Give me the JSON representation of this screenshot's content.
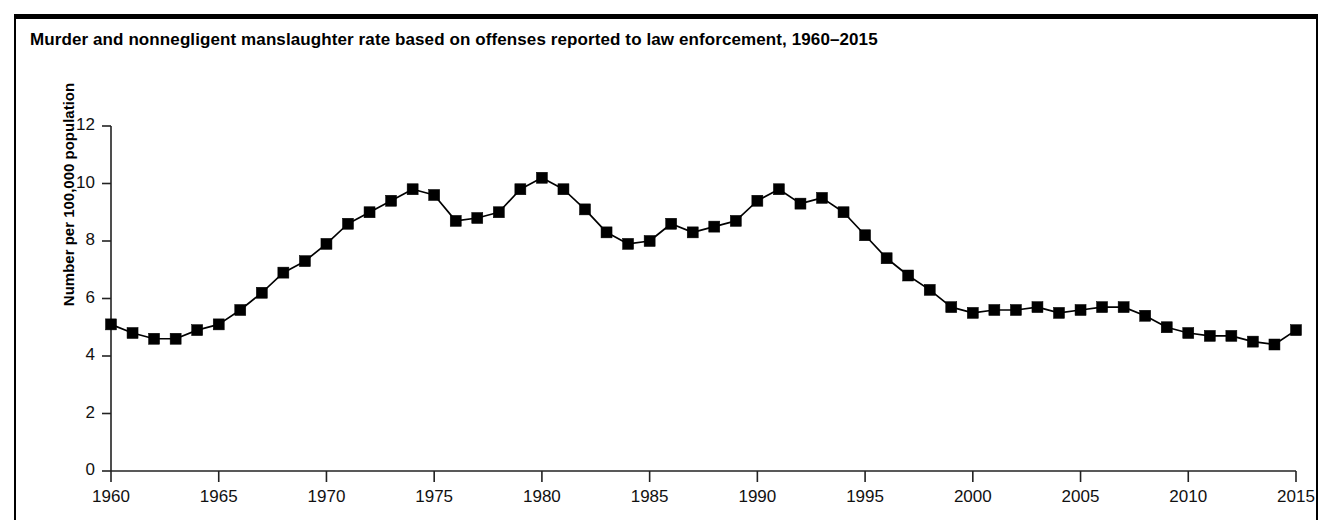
{
  "figure": {
    "title": "Murder and nonnegligent manslaughter rate based on offenses reported to law enforcement, 1960–2015",
    "background_color": "#ffffff",
    "frame_color": "#000000"
  },
  "chart_data": {
    "type": "line",
    "title": "Murder and nonnegligent manslaughter rate based on offenses reported to law enforcement, 1960–2015",
    "xlabel": "",
    "ylabel": "Number per 100,000 population",
    "xlim": [
      1960,
      2015
    ],
    "ylim": [
      0,
      12
    ],
    "ytick_values": [
      0,
      2,
      4,
      6,
      8,
      10,
      12
    ],
    "ytick_labels": [
      "0",
      "2",
      "4",
      "6",
      "8",
      "10",
      "12"
    ],
    "xtick_values": [
      1960,
      1965,
      1970,
      1975,
      1980,
      1985,
      1990,
      1995,
      2000,
      2005,
      2010,
      2015
    ],
    "xtick_labels": [
      "1960",
      "1965",
      "1970",
      "1975",
      "1980",
      "1985",
      "1990",
      "1995",
      "2000",
      "2005",
      "2010",
      "2015"
    ],
    "grid": false,
    "legend": null,
    "marker": "square",
    "marker_color": "#000000",
    "line_color": "#000000",
    "series": [
      {
        "name": "Murder and nonnegligent manslaughter rate",
        "x": [
          1960,
          1961,
          1962,
          1963,
          1964,
          1965,
          1966,
          1967,
          1968,
          1969,
          1970,
          1971,
          1972,
          1973,
          1974,
          1975,
          1976,
          1977,
          1978,
          1979,
          1980,
          1981,
          1982,
          1983,
          1984,
          1985,
          1986,
          1987,
          1988,
          1989,
          1990,
          1991,
          1992,
          1993,
          1994,
          1995,
          1996,
          1997,
          1998,
          1999,
          2000,
          2001,
          2002,
          2003,
          2004,
          2005,
          2006,
          2007,
          2008,
          2009,
          2010,
          2011,
          2012,
          2013,
          2014,
          2015
        ],
        "values": [
          5.1,
          4.8,
          4.6,
          4.6,
          4.9,
          5.1,
          5.6,
          6.2,
          6.9,
          7.3,
          7.9,
          8.6,
          9.0,
          9.4,
          9.8,
          9.6,
          8.7,
          8.8,
          9.0,
          9.8,
          10.2,
          9.8,
          9.1,
          8.3,
          7.9,
          8.0,
          8.6,
          8.3,
          8.5,
          8.7,
          9.4,
          9.8,
          9.3,
          9.5,
          9.0,
          8.2,
          7.4,
          6.8,
          6.3,
          5.7,
          5.5,
          5.6,
          5.6,
          5.7,
          5.5,
          5.6,
          5.7,
          5.7,
          5.4,
          5.0,
          4.8,
          4.7,
          4.7,
          4.5,
          4.4,
          4.9
        ]
      }
    ]
  },
  "axis": {
    "y_title": "Number per 100,000 population"
  }
}
